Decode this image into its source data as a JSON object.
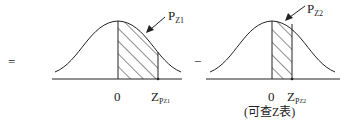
{
  "equation": {
    "equals_sign": "=",
    "minus_sign": "−"
  },
  "left_curve": {
    "zero_label": "0",
    "z_label_main": "Z",
    "z_label_sub": "P",
    "z_label_subsub": "Z1",
    "pointer_label_main": "P",
    "pointer_label_sub": "Z1"
  },
  "right_curve": {
    "zero_label": "0",
    "z_label_main": "Z",
    "z_label_sub": "P",
    "z_label_subsub": "Z2",
    "pointer_label_main": "P",
    "pointer_label_sub": "Z2",
    "note": "(可查Z表)"
  },
  "colors": {
    "stroke": "#222222",
    "background": "#ffffff"
  }
}
